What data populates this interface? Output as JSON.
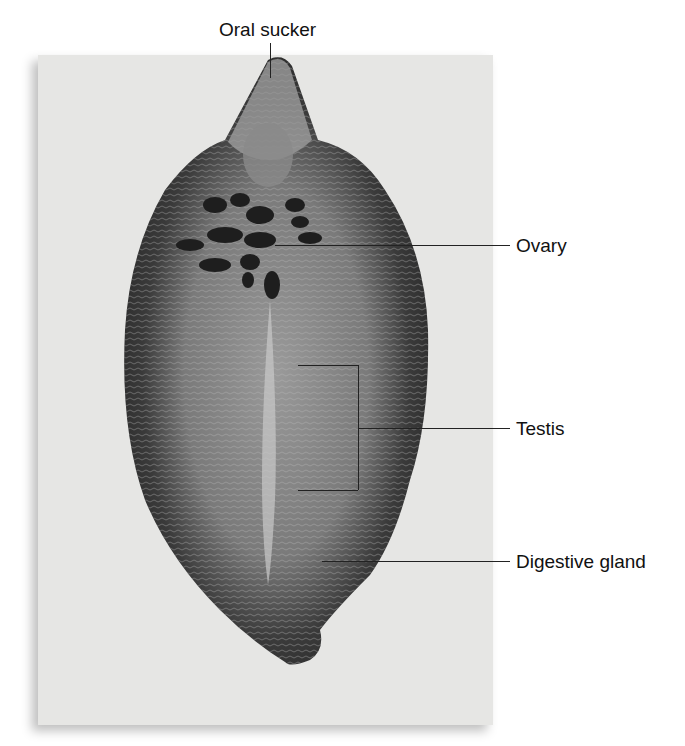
{
  "figure": {
    "labels": [
      {
        "id": "oral-sucker",
        "text": "Oral sucker"
      },
      {
        "id": "ovary",
        "text": "Ovary"
      },
      {
        "id": "testis",
        "text": "Testis"
      },
      {
        "id": "digestive-gland",
        "text": "Digestive gland"
      }
    ],
    "colors": {
      "background": "#ffffff",
      "photo_background": "#e6e6e4",
      "specimen_dark": "#2e2e2e",
      "specimen_mid": "#6a6a6a",
      "specimen_light": "#a8a8a8",
      "leader_line": "#222222",
      "text": "#111111"
    }
  }
}
